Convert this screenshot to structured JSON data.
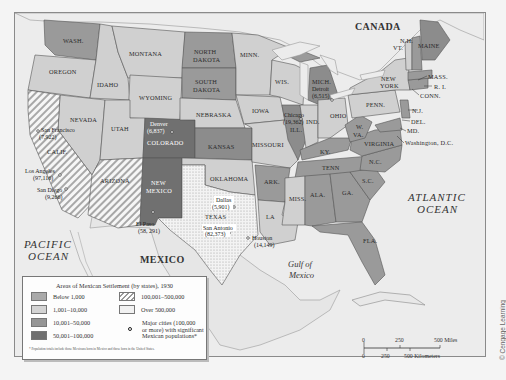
{
  "map": {
    "title": "Areas of Mexican Settlement (by states), 1930",
    "regions": {
      "canada": "CANADA",
      "mexico": "MEXICO",
      "pacific_line1": "PACIFIC",
      "pacific_line2": "OCEAN",
      "atlantic_line1": "ATLANTIC",
      "atlantic_line2": "OCEAN",
      "gulf_line1": "Gulf of",
      "gulf_line2": "Mexico"
    },
    "states": {
      "wash": "WASH.",
      "oregon": "OREGON",
      "idaho": "IDAHO",
      "montana": "MONTANA",
      "wyoming": "WYOMING",
      "nevada": "NEVADA",
      "utah": "UTAH",
      "calif": "CALIF.",
      "arizona": "ARIZONA",
      "colorado": "COLORADO",
      "new_mexico_1": "NEW",
      "new_mexico_2": "MEXICO",
      "north_dakota_1": "NORTH",
      "north_dakota_2": "DAKOTA",
      "south_dakota_1": "SOUTH",
      "south_dakota_2": "DAKOTA",
      "nebraska": "NEBRASKA",
      "kansas": "KANSAS",
      "oklahoma": "OKLAHOMA",
      "texas": "TEXAS",
      "minn": "MINN.",
      "iowa": "IOWA",
      "missouri": "MISSOURI",
      "ark": "ARK.",
      "la": "LA",
      "wis": "WIS.",
      "ill": "ILL.",
      "mich": "MICH.",
      "ind": "IND.",
      "ohio": "OHIO",
      "ky": "KY.",
      "tenn": "TENN",
      "miss": "MISS.",
      "ala": "ALA.",
      "ga": "GA.",
      "fla": "FLA.",
      "sc": "S.C.",
      "nc": "N.C.",
      "virginia": "VIRGINIA",
      "wva_1": "W.",
      "wva_2": "VA.",
      "penn": "PENN.",
      "new_york_1": "NEW",
      "new_york_2": "YORK",
      "nj": "N.J.",
      "del": "DEL.",
      "md": "MD.",
      "dc": "Washington, D.C.",
      "conn": "CONN.",
      "ri": "R. I.",
      "mass": "MASS.",
      "vt": "VT.",
      "nh": "N.H.",
      "maine": "MAINE"
    },
    "cities": [
      {
        "name": "San Francisco",
        "pop": "(7,922)"
      },
      {
        "name": "Los Angeles",
        "pop": "(97,116)"
      },
      {
        "name": "San Diego",
        "pop": "(9,266)"
      },
      {
        "name": "El Paso",
        "pop": "(58, 291)"
      },
      {
        "name": "Denver",
        "pop": "(6,837)"
      },
      {
        "name": "Dallas",
        "pop": "(5,901)"
      },
      {
        "name": "San Antonio",
        "pop": "(82,373)"
      },
      {
        "name": "Houston",
        "pop": "(14,149)"
      },
      {
        "name": "Chicago",
        "pop": "(19,362)"
      },
      {
        "name": "Detroit",
        "pop": "(6,515)"
      }
    ],
    "legend": {
      "items": [
        {
          "label": "Below 1,000",
          "color": "#a9a9a9"
        },
        {
          "label": "1,001–10,000",
          "color": "#d3d3d3"
        },
        {
          "label": "10,001–50,000",
          "color": "#959595"
        },
        {
          "label": "50,001–100,000",
          "color": "#6f6f6f"
        },
        {
          "label": "100,001–500,000",
          "pattern": "hatch"
        },
        {
          "label": "Over 500,000",
          "pattern": "dots"
        },
        {
          "label": "Major cities (100,000 or more) with significant Mexican populations*",
          "icon": "city-marker"
        }
      ],
      "major_cities_line1": "Major cities (100,000",
      "major_cities_line2": "or more) with significant",
      "major_cities_line3": "Mexican populations*",
      "footnote": "* Population totals include those Mexicans born in Mexico and those born in the United States."
    },
    "scale": {
      "miles_0": "0",
      "miles_250": "250",
      "miles_500": "500 Miles",
      "km_0": "0",
      "km_250": "250",
      "km_500": "500 Kilometers"
    },
    "credit": "© Cengage Learning"
  }
}
